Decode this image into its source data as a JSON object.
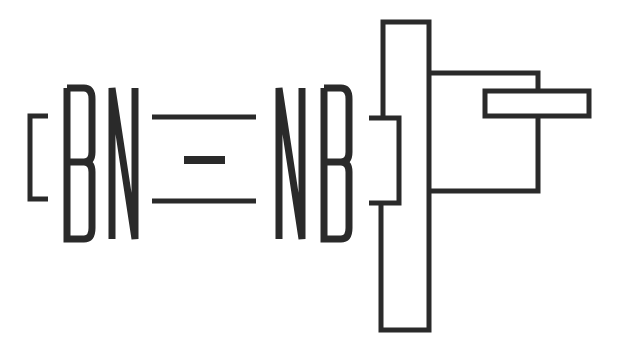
{
  "logo": {
    "text_left": "BN",
    "text_right": "NB",
    "ink_color": "#2a2a2a",
    "background": "#ffffff"
  }
}
